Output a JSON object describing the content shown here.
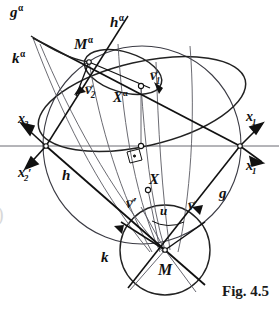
{
  "figure": {
    "caption": "Fig. 4.5",
    "domain": "descriptive-geometry-construction",
    "background": "#ffffff",
    "ink": "#111111",
    "thin_ink": "#55555f"
  },
  "labels": [
    {
      "id": "g-alpha",
      "text": "g",
      "sup": "α",
      "x": 10,
      "y": 4,
      "size": 15
    },
    {
      "id": "k-alpha",
      "text": "k",
      "sup": "α",
      "x": 12,
      "y": 50,
      "size": 15
    },
    {
      "id": "h-alpha",
      "text": "h",
      "sup": "α",
      "x": 110,
      "y": 14,
      "size": 15
    },
    {
      "id": "M-alpha",
      "text": "M",
      "sup": "α",
      "x": 74,
      "y": 36,
      "size": 15
    },
    {
      "id": "X-alpha",
      "text": "X",
      "sup": "α",
      "x": 113,
      "y": 89,
      "size": 14
    },
    {
      "id": "x2",
      "text": "x",
      "sub": "2",
      "x": 18,
      "y": 112,
      "size": 14
    },
    {
      "id": "x2-prime",
      "text": "x",
      "sub": "2",
      "prime": "′",
      "x": 18,
      "y": 166,
      "size": 14
    },
    {
      "id": "x1",
      "text": "x",
      "sub": "1",
      "x": 246,
      "y": 110,
      "size": 14
    },
    {
      "id": "x1-prime",
      "text": "x",
      "sub": "1",
      "prime": "′",
      "x": 246,
      "y": 159,
      "size": 14
    },
    {
      "id": "h-line",
      "text": "h",
      "x": 62,
      "y": 168,
      "size": 15
    },
    {
      "id": "g-line",
      "text": "g",
      "x": 219,
      "y": 186,
      "size": 15
    },
    {
      "id": "X-point",
      "text": "X",
      "x": 149,
      "y": 172,
      "size": 15
    },
    {
      "id": "k-circle",
      "text": "k",
      "x": 101,
      "y": 250,
      "size": 15
    },
    {
      "id": "M-point",
      "text": "M",
      "x": 158,
      "y": 262,
      "size": 16
    },
    {
      "id": "u-angle",
      "text": "u",
      "x": 160,
      "y": 204,
      "size": 13
    }
  ],
  "vectors": [
    {
      "id": "v1",
      "text": "v",
      "sub": "1",
      "x": 150,
      "y": 68,
      "size": 15
    },
    {
      "id": "v2",
      "text": "v",
      "sub": "2",
      "x": 85,
      "y": 82,
      "size": 15
    },
    {
      "id": "v",
      "text": "v",
      "x": 188,
      "y": 198,
      "size": 15
    },
    {
      "id": "v-prime",
      "text": "v",
      "prime": "′",
      "x": 126,
      "y": 196,
      "size": 15
    }
  ],
  "bleed_mark": {
    "text": ")",
    "x": -3,
    "y": 205,
    "size": 20
  }
}
